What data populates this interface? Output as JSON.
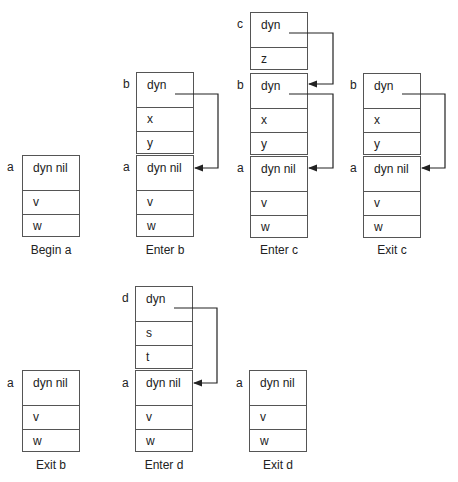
{
  "snapshots": [
    {
      "caption": "Begin a",
      "frames": [
        {
          "name": "a",
          "link": "dyn nil",
          "vars": [
            "v",
            "w"
          ]
        }
      ]
    },
    {
      "caption": "Enter b",
      "frames": [
        {
          "name": "b",
          "link": "dyn",
          "vars": [
            "x",
            "y"
          ]
        },
        {
          "name": "a",
          "link": "dyn nil",
          "vars": [
            "v",
            "w"
          ]
        }
      ]
    },
    {
      "caption": "Enter c",
      "frames": [
        {
          "name": "c",
          "link": "dyn",
          "vars": [
            "z"
          ]
        },
        {
          "name": "b",
          "link": "dyn",
          "vars": [
            "x",
            "y"
          ]
        },
        {
          "name": "a",
          "link": "dyn nil",
          "vars": [
            "v",
            "w"
          ]
        }
      ]
    },
    {
      "caption": "Exit c",
      "frames": [
        {
          "name": "b",
          "link": "dyn",
          "vars": [
            "x",
            "y"
          ]
        },
        {
          "name": "a",
          "link": "dyn nil",
          "vars": [
            "v",
            "w"
          ]
        }
      ]
    },
    {
      "caption": "Exit b",
      "frames": [
        {
          "name": "a",
          "link": "dyn nil",
          "vars": [
            "v",
            "w"
          ]
        }
      ]
    },
    {
      "caption": "Enter d",
      "frames": [
        {
          "name": "d",
          "link": "dyn",
          "vars": [
            "s",
            "t"
          ]
        },
        {
          "name": "a",
          "link": "dyn nil",
          "vars": [
            "v",
            "w"
          ]
        }
      ]
    },
    {
      "caption": "Exit d",
      "frames": [
        {
          "name": "a",
          "link": "dyn nil",
          "vars": [
            "v",
            "w"
          ]
        }
      ]
    }
  ]
}
